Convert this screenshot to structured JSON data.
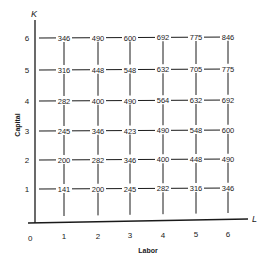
{
  "chart_data": {
    "type": "table",
    "title": "",
    "xlabel": "Labor",
    "ylabel": "Capital",
    "x_axis_symbol": "L",
    "y_axis_symbol": "K",
    "origin_label": "0",
    "x_ticks": [
      "1",
      "2",
      "3",
      "4",
      "5",
      "6"
    ],
    "y_ticks": [
      "1",
      "2",
      "3",
      "4",
      "5",
      "6"
    ],
    "grid": true,
    "rows": [
      {
        "capital": 6,
        "values": [
          346,
          490,
          600,
          692,
          775,
          846
        ]
      },
      {
        "capital": 5,
        "values": [
          316,
          448,
          548,
          632,
          705,
          775
        ]
      },
      {
        "capital": 4,
        "values": [
          282,
          400,
          490,
          564,
          632,
          692
        ]
      },
      {
        "capital": 3,
        "values": [
          245,
          346,
          423,
          490,
          548,
          600
        ]
      },
      {
        "capital": 2,
        "values": [
          200,
          282,
          346,
          400,
          448,
          490
        ]
      },
      {
        "capital": 1,
        "values": [
          141,
          200,
          245,
          282,
          316,
          346
        ]
      }
    ]
  },
  "colors": {
    "ink": "#1a1a1a",
    "background": "#ffffff"
  }
}
